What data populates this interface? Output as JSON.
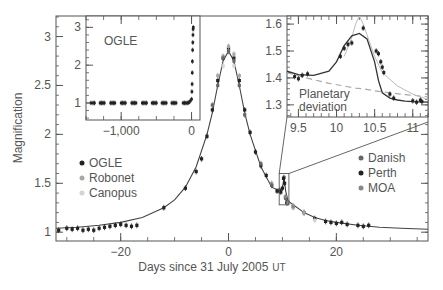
{
  "chart_data": [
    {
      "id": "main",
      "type": "scatter",
      "title": "",
      "xlabel": "Days since 31 July 2005",
      "xlabel_suffix": "UT",
      "ylabel": "Magnification",
      "xlim": [
        -32,
        37
      ],
      "ylim": [
        0.91,
        3.21
      ],
      "xticks": [
        -20,
        0,
        20
      ],
      "xtick_labels": [
        "−20",
        "0",
        "20"
      ],
      "yticks": [
        1,
        1.5,
        2,
        2.5,
        3
      ],
      "ytick_labels": [
        "1",
        "1.5",
        "2",
        "2.5",
        "3"
      ],
      "grid": false,
      "legend_left": [
        {
          "label": "OGLE",
          "color": "#222222"
        },
        {
          "label": "Robonet",
          "color": "#a8a8a8"
        },
        {
          "label": "Canopus",
          "color": "#d4d4d4"
        }
      ],
      "legend_right": [
        {
          "label": "Danish",
          "color": "#666666"
        },
        {
          "label": "Perth",
          "color": "#222222"
        },
        {
          "label": "MOA",
          "color": "#888888"
        }
      ],
      "model_curve": {
        "x": [
          -32,
          -28,
          -24,
          -20,
          -16,
          -12,
          -10,
          -8,
          -6,
          -4,
          -3,
          -2,
          -1,
          0,
          1,
          2,
          3,
          4,
          6,
          8,
          9.5,
          10,
          10.3,
          10.6,
          11,
          12,
          14,
          16,
          18,
          20,
          24,
          28,
          32,
          37
        ],
        "y": [
          1.04,
          1.05,
          1.07,
          1.1,
          1.15,
          1.25,
          1.33,
          1.46,
          1.67,
          2.0,
          2.22,
          2.5,
          2.75,
          2.85,
          2.75,
          2.5,
          2.22,
          2.0,
          1.67,
          1.46,
          1.42,
          1.45,
          1.56,
          1.42,
          1.32,
          1.28,
          1.2,
          1.15,
          1.12,
          1.1,
          1.07,
          1.05,
          1.04,
          1.03
        ]
      },
      "series": [
        {
          "name": "OGLE",
          "color": "#222222",
          "x": [
            -31.5,
            -30,
            -29,
            -28,
            -27,
            -26,
            -25,
            -24,
            -23,
            -22,
            -21,
            -20,
            -19,
            -18,
            -17,
            -12,
            -8,
            -6,
            -5,
            -4,
            -3,
            -2,
            -1,
            0,
            1,
            2,
            3,
            4,
            5,
            6,
            7,
            8,
            9,
            12,
            14,
            16,
            18,
            19,
            20,
            21,
            22,
            24,
            25,
            26
          ],
          "y": [
            1.02,
            1.04,
            1.03,
            1.04,
            1.02,
            1.03,
            1.02,
            1.04,
            1.05,
            1.06,
            1.07,
            1.08,
            1.07,
            1.06,
            1.07,
            1.25,
            1.45,
            1.62,
            1.75,
            1.98,
            2.25,
            2.55,
            2.78,
            2.88,
            2.78,
            2.55,
            2.25,
            2.02,
            1.82,
            1.68,
            1.58,
            1.48,
            1.42,
            1.26,
            1.2,
            1.14,
            1.11,
            1.1,
            1.09,
            1.1,
            1.08,
            1.07,
            1.06,
            1.07
          ]
        },
        {
          "name": "Robonet",
          "color": "#a8a8a8",
          "x": [
            -2,
            -1,
            0,
            1,
            2,
            8,
            10.5,
            12,
            14
          ],
          "y": [
            2.6,
            2.8,
            2.9,
            2.82,
            2.6,
            1.5,
            1.36,
            1.27,
            1.2
          ]
        },
        {
          "name": "Canopus",
          "color": "#d4d4d4",
          "x": [
            -1,
            0,
            1,
            12,
            16
          ],
          "y": [
            2.7,
            2.85,
            2.7,
            1.25,
            1.12
          ]
        },
        {
          "name": "Danish",
          "color": "#666666",
          "x": [
            -3,
            -2,
            -1,
            0,
            1,
            2,
            3,
            6,
            8,
            9.5,
            10.3,
            11
          ],
          "y": [
            2.3,
            2.5,
            2.78,
            2.85,
            2.75,
            2.5,
            2.2,
            1.7,
            1.48,
            1.43,
            1.56,
            1.31
          ]
        },
        {
          "name": "Perth",
          "color": "#222222",
          "x": [
            9.5,
            9.7,
            10,
            10.2,
            10.4,
            10.6,
            10.8
          ],
          "y": [
            1.42,
            1.41,
            1.45,
            1.55,
            1.5,
            1.35,
            1.3
          ]
        },
        {
          "name": "MOA",
          "color": "#888888",
          "x": [
            10.6,
            11,
            12
          ],
          "y": [
            1.36,
            1.3,
            1.26
          ]
        }
      ],
      "zoom_box": {
        "x0": 9.4,
        "x1": 11.2,
        "y0": 1.28,
        "y1": 1.6
      }
    },
    {
      "id": "inset_baseline",
      "type": "scatter",
      "label": "OGLE",
      "xlim": [
        -1500,
        120
      ],
      "ylim": [
        0.55,
        3.3
      ],
      "xticks": [
        -1000,
        0
      ],
      "xtick_labels": [
        "−1,000",
        "0"
      ],
      "yticks": [
        1,
        2,
        3
      ],
      "ytick_labels": [
        "1",
        "2",
        "3"
      ],
      "series": [
        {
          "name": "OGLE",
          "color": "#222222",
          "x": [
            -1430,
            -1400,
            -1380,
            -1300,
            -1280,
            -1260,
            -1240,
            -1150,
            -1130,
            -1110,
            -1090,
            -1000,
            -980,
            -960,
            -940,
            -850,
            -830,
            -810,
            -790,
            -700,
            -680,
            -660,
            -640,
            -560,
            -540,
            -520,
            -500,
            -420,
            -400,
            -380,
            -360,
            -280,
            -260,
            -240,
            -220,
            -120,
            -100,
            -80,
            -60,
            -40,
            -20,
            0,
            5,
            8,
            10,
            12,
            15,
            18,
            20,
            22,
            25
          ],
          "y": [
            1,
            1,
            1,
            1,
            1,
            1,
            1,
            1,
            1,
            1,
            1,
            1,
            1,
            1,
            1,
            1,
            1,
            1,
            1,
            1,
            1,
            1,
            1,
            1,
            1,
            1,
            1,
            1,
            1,
            1,
            1,
            1,
            1,
            1,
            1,
            1,
            1,
            1,
            1,
            1.01,
            1.05,
            1.1,
            1.3,
            1.5,
            1.8,
            2.1,
            2.4,
            2.6,
            2.8,
            2.95,
            3.0
          ]
        }
      ]
    },
    {
      "id": "inset_planetary",
      "type": "scatter",
      "label": "Planetary deviation",
      "xlim": [
        9.35,
        11.2
      ],
      "ylim": [
        1.255,
        1.63
      ],
      "xticks": [
        9.5,
        10,
        10.5,
        11
      ],
      "xtick_labels": [
        "9.5",
        "10",
        "10.5",
        "11"
      ],
      "yticks": [
        1.3,
        1.4,
        1.5,
        1.6
      ],
      "ytick_labels": [
        "1.3",
        "1.4",
        "1.5",
        "1.6"
      ],
      "model_curve": {
        "x": [
          9.35,
          9.5,
          9.7,
          9.9,
          10.0,
          10.1,
          10.2,
          10.3,
          10.4,
          10.5,
          10.55,
          10.6,
          10.7,
          10.8,
          10.9,
          11.0,
          11.2
        ],
        "y": [
          1.425,
          1.412,
          1.41,
          1.425,
          1.46,
          1.52,
          1.556,
          1.565,
          1.545,
          1.46,
          1.39,
          1.345,
          1.325,
          1.318,
          1.314,
          1.312,
          1.31
        ]
      },
      "no_planet_curve": {
        "x": [
          9.35,
          9.6,
          9.9,
          10.1,
          10.25,
          10.35,
          10.5,
          10.7,
          10.9,
          11.2
        ],
        "y": [
          1.42,
          1.4,
          1.38,
          1.37,
          1.362,
          1.36,
          1.352,
          1.345,
          1.338,
          1.33
        ]
      },
      "single_lens_curve": {
        "x": [
          10.1,
          10.2,
          10.25,
          10.3,
          10.35,
          10.4,
          10.5,
          10.6,
          10.8,
          11.0,
          11.2
        ],
        "y": [
          1.48,
          1.55,
          1.6,
          1.63,
          1.6,
          1.56,
          1.48,
          1.42,
          1.37,
          1.34,
          1.32
        ]
      },
      "series": [
        {
          "name": "data",
          "color": "#222222",
          "x": [
            9.45,
            9.5,
            9.55,
            9.62,
            10.05,
            10.1,
            10.15,
            10.2,
            10.35,
            10.52,
            10.55,
            10.58,
            10.6,
            10.62,
            10.7,
            10.75,
            11.0,
            11.05,
            11.1,
            11.12
          ],
          "y": [
            1.405,
            1.397,
            1.41,
            1.415,
            1.48,
            1.51,
            1.525,
            1.53,
            1.585,
            1.5,
            1.49,
            1.46,
            1.44,
            1.42,
            1.34,
            1.325,
            1.315,
            1.31,
            1.318,
            1.312
          ]
        }
      ]
    }
  ]
}
